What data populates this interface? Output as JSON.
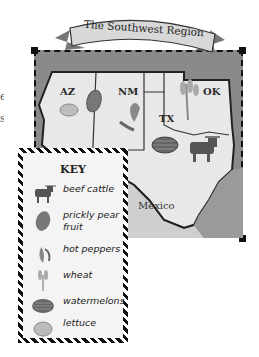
{
  "title": "The Southwest Region",
  "edge_text_fragments": [
    "e",
    "s"
  ],
  "map": {
    "states": [
      {
        "abbr": "AZ",
        "products": [
          "lettuce",
          "prickly pear fruit"
        ]
      },
      {
        "abbr": "NM",
        "products": [
          "hot peppers"
        ]
      },
      {
        "abbr": "TX",
        "products": [
          "watermelons",
          "beef cattle"
        ]
      },
      {
        "abbr": "OK",
        "products": [
          "wheat"
        ]
      }
    ],
    "neighbor_label": "Mexico"
  },
  "key": {
    "title": "KEY",
    "items": [
      {
        "icon": "beef-cattle-icon",
        "label": "beef cattle"
      },
      {
        "icon": "prickly-pear-icon",
        "label": "prickly pear fruit"
      },
      {
        "icon": "hot-peppers-icon",
        "label": "hot peppers"
      },
      {
        "icon": "wheat-icon",
        "label": "wheat"
      },
      {
        "icon": "watermelon-icon",
        "label": "watermelons"
      },
      {
        "icon": "lettuce-icon",
        "label": "lettuce"
      }
    ]
  },
  "colors": {
    "water": "#8a8a8a",
    "land": "#e6e6e6",
    "border": "#222222",
    "key_bg": "#f4f4f4"
  }
}
